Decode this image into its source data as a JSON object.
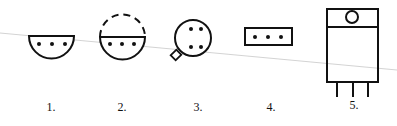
{
  "diagram": {
    "type": "component-package-outlines",
    "stroke_color": "#111111",
    "background": "#ffffff",
    "items": [
      {
        "label": "1.",
        "shape": "half-circle with three pins",
        "pins": 3
      },
      {
        "label": "2.",
        "shape": "half-circle with dashed upper half and three pins",
        "pins": 3
      },
      {
        "label": "3.",
        "shape": "circle with four pins and key tab",
        "pins": 4
      },
      {
        "label": "4.",
        "shape": "rectangle with three pins",
        "pins": 3
      },
      {
        "label": "5.",
        "shape": "TO-220 style package with mounting hole and three leads",
        "pins": 3
      }
    ]
  }
}
